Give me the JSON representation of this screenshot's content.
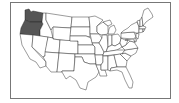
{
  "map": {
    "subject": "United States",
    "highlighted_states": [
      "Washington",
      "Oregon"
    ],
    "colors": {
      "highlight": "#555555",
      "default": "#ffffff",
      "border": "#222222",
      "frame": "#777777"
    }
  }
}
